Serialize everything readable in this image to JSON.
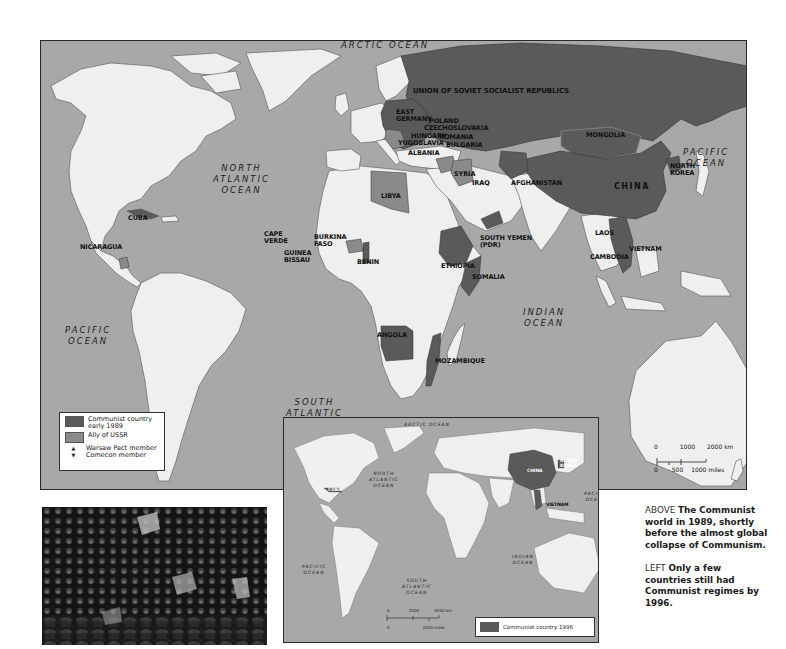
{
  "main_map": {
    "oceans": {
      "arctic": "ARCTIC OCEAN",
      "north_atlantic": [
        "NORTH",
        "ATLANTIC",
        "OCEAN"
      ],
      "pacific_east": [
        "PACIFIC",
        "OCEAN"
      ],
      "pacific_west": [
        "PACIFIC",
        "OCEAN"
      ],
      "south_atlantic": [
        "SOUTH",
        "ATLANTIC",
        "OCEAN"
      ],
      "indian": [
        "INDIAN",
        "OCEAN"
      ]
    },
    "countries": {
      "ussr": "UNION OF SOVIET SOCIALIST REPUBLICS",
      "east_germany": [
        "EAST",
        "GERMANY"
      ],
      "poland": "POLAND",
      "czechoslovakia": "CZECHOSLOVAKIA",
      "hungary": "HUNGARY",
      "romania": "ROMANIA",
      "yugoslavia": "YUGOSLAVIA",
      "bulgaria": "BULGARIA",
      "albania": "ALBANIA",
      "mongolia": "MONGOLIA",
      "china": "CHINA",
      "north_korea": [
        "NORTH",
        "KOREA"
      ],
      "syria": "SYRIA",
      "iraq": "IRAQ",
      "afghanistan": "AFGHANISTAN",
      "libya": "LIBYA",
      "cuba": "CUBA",
      "nicaragua": "NICARAGUA",
      "cape_verde": [
        "CAPE",
        "VERDE"
      ],
      "guinea_bissau": [
        "GUINEA",
        "BISSAU"
      ],
      "burkina_faso": [
        "BURKINA",
        "FASO"
      ],
      "benin": "BENIN",
      "ethiopia": "ETHIOPIA",
      "somalia": "SOMALIA",
      "south_yemen": [
        "SOUTH YEMEN",
        "(PDR)"
      ],
      "angola": "ANGOLA",
      "mozambique": "MOZAMBIQUE",
      "laos": "LAOS",
      "vietnam": "VIETNAM",
      "cambodia": "CAMBODIA"
    },
    "legend": {
      "items": [
        {
          "label": "Communist country early 1989",
          "color": "#5a5a5a",
          "kind": "swatch"
        },
        {
          "label": "Ally of USSR",
          "color": "#8a8a8a",
          "kind": "swatch"
        },
        {
          "label": "Warsaw Pact member",
          "symbol": "▲",
          "kind": "symbol"
        },
        {
          "label": "Comecon member",
          "symbol": "▼",
          "kind": "symbol"
        }
      ]
    },
    "scale": {
      "km_ticks": [
        "0",
        "1000",
        "2000 km"
      ],
      "mile_ticks": [
        "0",
        "500",
        "1000 miles"
      ]
    }
  },
  "inset_map": {
    "oceans": {
      "arctic": "ARCTIC OCEAN",
      "north_atlantic": [
        "NORTH",
        "ATLANTIC",
        "OCEAN"
      ],
      "pacific_west": [
        "PACIFIC",
        "OCEAN"
      ],
      "pacific_east": [
        "PACIFIC",
        "OCEAN"
      ],
      "south_atlantic": [
        "SOUTH",
        "ATLANTIC",
        "OCEAN"
      ],
      "indian": [
        "INDIAN",
        "OCEAN"
      ]
    },
    "countries": {
      "china": "CHINA",
      "north_korea": [
        "NORTH",
        "KOREA"
      ],
      "vietnam": "VIETNAM",
      "cuba": "CUBA"
    },
    "legend": {
      "label": "Communist country 1996",
      "color": "#5a5a5a"
    },
    "scale": {
      "km_ticks": [
        "0",
        "2000",
        "4000 km"
      ],
      "mile_ticks": [
        "0",
        "2000 miles"
      ]
    }
  },
  "photo": {
    "description": "crowd-photo"
  },
  "caption": {
    "above_prefix": "ABOVE",
    "above_text": "The Communist world in 1989, shortly before the almost global collapse of Communism.",
    "left_prefix": "LEFT",
    "left_text": "Only a few countries still had Communist regimes by 1996."
  },
  "colors": {
    "ocean": "#a8a8a8",
    "land": "#efefef",
    "communist": "#5a5a5a",
    "ally": "#8a8a8a"
  }
}
